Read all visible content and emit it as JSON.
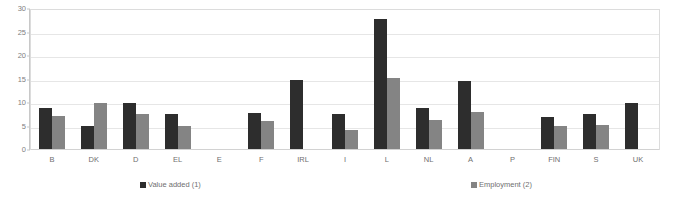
{
  "chart_data": {
    "type": "bar",
    "title": "",
    "subtitle": "",
    "xlabel": "",
    "ylabel": "",
    "ylim": [
      0,
      30
    ],
    "yticks": [
      0,
      5,
      10,
      15,
      20,
      25,
      30
    ],
    "ytick_labels": [
      "0",
      "5",
      "10",
      "15",
      "20",
      "25",
      "30"
    ],
    "grid": true,
    "legend_position": "bottom",
    "categories": [
      "B",
      "DK",
      "D",
      "EL",
      "E",
      "F",
      "IRL",
      "I",
      "L",
      "NL",
      "A",
      "P",
      "FIN",
      "S",
      "UK"
    ],
    "series": [
      {
        "name": "Value added (1)",
        "color": "#2d2d2d",
        "values": [
          8.8,
          5.0,
          10.0,
          7.5,
          null,
          7.8,
          14.8,
          7.6,
          28.0,
          8.8,
          14.6,
          null,
          7.0,
          7.5,
          10.0
        ]
      },
      {
        "name": "Employment (2)",
        "color": "#848484",
        "values": [
          7.2,
          10.0,
          7.5,
          5.0,
          null,
          6.0,
          null,
          4.2,
          15.3,
          6.2,
          8.0,
          null,
          5.0,
          5.2,
          null
        ]
      }
    ],
    "legend": [
      {
        "label": "Value added (1)",
        "color": "#2d2d2d"
      },
      {
        "label": "Employment (2)",
        "color": "#848484"
      }
    ],
    "colors": {
      "value_added": "#2d2d2d",
      "employment": "#848484",
      "gridline": "#e6e6e6",
      "frame": "#dcdcdc",
      "axis": "#c8c8c8",
      "text": "#6f6f6f",
      "background": "#ffffff"
    }
  }
}
